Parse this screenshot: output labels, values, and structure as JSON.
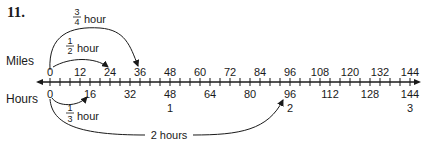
{
  "problem_number": "11.",
  "labels": {
    "miles": "Miles",
    "hours": "Hours"
  },
  "axis": {
    "min": 0,
    "max": 144,
    "minor_tick_step": 4
  },
  "miles_ticks": [
    "0",
    "12",
    "24",
    "36",
    "48",
    "60",
    "72",
    "84",
    "96",
    "108",
    "120",
    "132",
    "144"
  ],
  "hours_ticks_miles": [
    "0",
    "16",
    "32",
    "48",
    "64",
    "80",
    "96",
    "112",
    "128",
    "144"
  ],
  "hours_ticks_hours": [
    {
      "at": 48,
      "label": "1"
    },
    {
      "at": 96,
      "label": "2"
    },
    {
      "at": 144,
      "label": "3"
    }
  ],
  "arcs": {
    "three_quarter": {
      "num": "3",
      "den": "4",
      "unit": "hour",
      "from": 0,
      "to": 36
    },
    "half": {
      "num": "1",
      "den": "2",
      "unit": "hour",
      "from": 0,
      "to": 24
    },
    "third": {
      "num": "1",
      "den": "3",
      "unit": "hour",
      "from": 0,
      "to": 16
    },
    "two_hours": {
      "label": "2 hours",
      "from": 0,
      "to": 96
    }
  },
  "colors": {
    "ink": "#1a1a1a",
    "background": "#ffffff"
  }
}
